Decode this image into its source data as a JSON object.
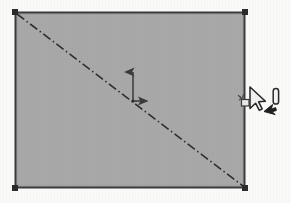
{
  "app": {
    "title": "CAD Drawing Canvas",
    "canvas_background_color": "#fbfbfa"
  },
  "canvas": {
    "width": 291,
    "height": 203
  },
  "shape": {
    "name": "rectangle",
    "label": "Rectangle",
    "state": "selected",
    "fill_color": "#a9a9a9",
    "stroke_color": "#3b3b3b",
    "stroke_width": 2,
    "x": 15,
    "y": 12,
    "width": 230,
    "height": 176
  },
  "handles": {
    "label": "Selection grip handles",
    "color": "#2b2b2b",
    "size": 6,
    "points": [
      {
        "name": "top-left",
        "x": 15,
        "y": 12
      },
      {
        "name": "top-right",
        "x": 245,
        "y": 12
      },
      {
        "name": "bottom-left",
        "x": 15,
        "y": 188
      },
      {
        "name": "bottom-right",
        "x": 245,
        "y": 188
      }
    ]
  },
  "centerline": {
    "label": "Diagonal centerline",
    "style": "dash-dot",
    "color": "#2e2e2e",
    "width": 1.6,
    "dash_pattern": "9 3 1.5 3",
    "x1": 17,
    "y1": 14,
    "x2": 243,
    "y2": 186
  },
  "origin_marker": {
    "label": "Origin axis indicator",
    "color": "#3a3a3a",
    "origin_x": 133,
    "origin_y": 101,
    "y_axis": {
      "name": "y-axis-arrow",
      "tip_x": 133,
      "tip_y": 70,
      "label": "Y"
    },
    "x_axis": {
      "name": "x-axis-arrow",
      "tip_x": 149,
      "tip_y": 101,
      "label": "X"
    }
  },
  "cursors": [
    {
      "name": "move-handle-icon",
      "label": "Move grip",
      "x": 241,
      "y": 96,
      "color": "#4a4a4a"
    },
    {
      "name": "mouse-pointer-cursor",
      "label": "Mouse pointer",
      "x": 250,
      "y": 88,
      "color": "#ffffff",
      "outline_color": "#2a2a2a"
    },
    {
      "name": "text-caret-icon",
      "label": "I-beam caret",
      "x": 274,
      "y": 88,
      "color": "#ffffff",
      "outline_color": "#2b2b2b"
    },
    {
      "name": "small-arrow-icon",
      "label": "Small black arrow",
      "x": 266,
      "y": 104,
      "color": "#1f1f1f"
    }
  ]
}
